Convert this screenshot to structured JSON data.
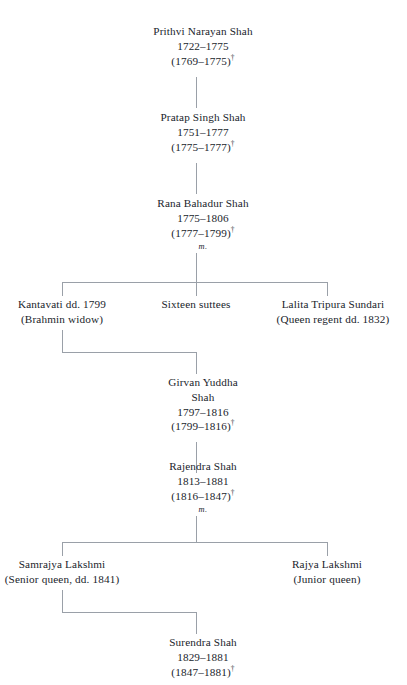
{
  "diagram": {
    "type": "genealogy-tree",
    "line_color": "#9aa0a8",
    "text_color": "#20242b",
    "background": "#ffffff",
    "dagger_symbol": "†",
    "marriage_marker": "m.",
    "nodes": [
      {
        "id": "prithvi",
        "name": "Prithvi Narayan Shah",
        "life": "1722–1775",
        "reign": "(1769–1775)",
        "marriage": ""
      },
      {
        "id": "pratap",
        "name": "Pratap Singh Shah",
        "life": "1751–1777",
        "reign": "(1775–1777)",
        "marriage": ""
      },
      {
        "id": "rana-bahadur",
        "name": "Rana Bahadur Shah",
        "life": "1775–1806",
        "reign": "(1777–1799)",
        "marriage": "m."
      },
      {
        "id": "kantavati",
        "name": "Kantavati dd. 1799",
        "sub": "(Brahmin widow)"
      },
      {
        "id": "suttees",
        "name": "Sixteen suttees",
        "sub": ""
      },
      {
        "id": "lalita",
        "name": "Lalita Tripura Sundari",
        "sub": "(Queen regent dd. 1832)"
      },
      {
        "id": "girvan",
        "name": "Girvan Yuddha\nShah",
        "life": "1797–1816",
        "reign": "(1799–1816)",
        "marriage": ""
      },
      {
        "id": "rajendra",
        "name": "Rajendra Shah",
        "life": "1813–1881",
        "reign": "(1816–1847)",
        "marriage": "m."
      },
      {
        "id": "samrajya",
        "name": "Samrajya Lakshmi",
        "sub": "(Senior queen, dd. 1841)"
      },
      {
        "id": "rajya",
        "name": "Rajya Lakshmi",
        "sub": "(Junior queen)"
      },
      {
        "id": "surendra",
        "name": "Surendra Shah",
        "life": "1829–1881",
        "reign": "(1847–1881)",
        "marriage": ""
      }
    ]
  }
}
